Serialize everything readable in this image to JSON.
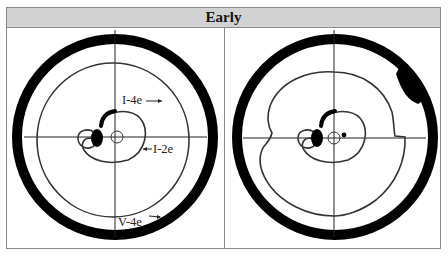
{
  "header": {
    "title": "Early"
  },
  "panels": [
    {
      "id": "left",
      "labels": {
        "i4e": "I-4e",
        "i2e": "I-2e",
        "v4e": "V-4e"
      }
    },
    {
      "id": "right",
      "labels": {}
    }
  ],
  "colors": {
    "header_bg": "#d2d2d2",
    "ink": "#111111",
    "isopter": "#333333",
    "border": "#8a8a8a"
  }
}
